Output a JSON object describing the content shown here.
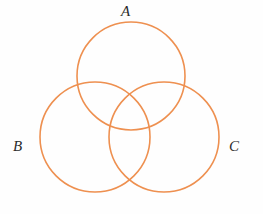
{
  "figure": {
    "background_color": "#fefefe",
    "width": 263,
    "height": 214
  },
  "diagram": {
    "type": "venn",
    "set_count": 3,
    "stroke_color": "#ee9050",
    "stroke_width": 1.6,
    "fill": "none",
    "label_color": "#2b2b2b",
    "sets": [
      {
        "id": "A",
        "label": "A",
        "label_position": "top",
        "cx": 131,
        "cy": 76,
        "r": 54,
        "label_x": 130,
        "label_y": 12
      },
      {
        "id": "B",
        "label": "B",
        "label_position": "left",
        "cx": 95,
        "cy": 137,
        "r": 55,
        "label_x": 20,
        "label_y": 147
      },
      {
        "id": "C",
        "label": "C",
        "label_position": "right",
        "cx": 164,
        "cy": 137,
        "r": 55,
        "label_x": 236,
        "label_y": 147
      }
    ],
    "regions": [
      "A only",
      "B only",
      "C only",
      "A ∩ B",
      "A ∩ C",
      "B ∩ C",
      "A ∩ B ∩ C"
    ]
  }
}
